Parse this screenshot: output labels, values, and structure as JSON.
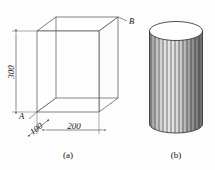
{
  "figure": {
    "background_color": "#fdfdfd",
    "line_color": "#4a4a52",
    "text_color": "#111111",
    "panels": [
      {
        "id": "a",
        "caption": "(a)",
        "shape": "rectangular-box",
        "point_labels": [
          {
            "name": "A",
            "text": "A",
            "position": "bottom-left-front-corner"
          },
          {
            "name": "B",
            "text": "B",
            "position": "top-right-back-corner"
          }
        ],
        "dimensions": [
          {
            "name": "height",
            "text": "300",
            "orientation": "vertical",
            "side": "left"
          },
          {
            "name": "depth",
            "text": "100",
            "orientation": "oblique",
            "side": "bottom-left"
          },
          {
            "name": "width",
            "text": "200",
            "orientation": "horizontal",
            "side": "bottom-front"
          }
        ]
      },
      {
        "id": "b",
        "caption": "(b)",
        "shape": "fluted-cylinder",
        "flute_count": 25,
        "point_labels": [],
        "dimensions": []
      }
    ]
  },
  "captions": {
    "panel_a": "(a)",
    "panel_b": "(b)"
  },
  "labels": {
    "point_a": "A",
    "point_b": "B",
    "dim_height": "300",
    "dim_depth": "100",
    "dim_width": "200"
  }
}
